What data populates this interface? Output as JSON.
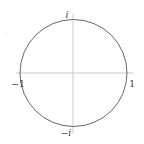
{
  "diagram": {
    "colors": {
      "circle": "#555555",
      "axes": "#bbbbbb",
      "labels": "#333333",
      "background": "#ffffff"
    },
    "labels": {
      "top": "i",
      "bottom": "−i",
      "left": "−1",
      "right": "1"
    }
  }
}
